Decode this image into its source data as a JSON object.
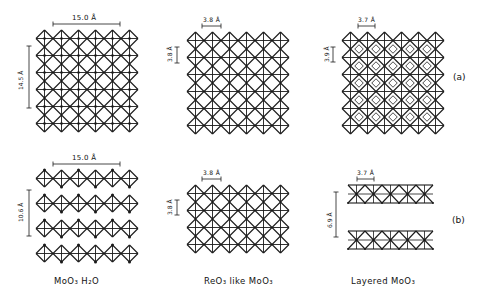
{
  "figure": {
    "rows": [
      {
        "id": "a",
        "label": "(a)"
      },
      {
        "id": "b",
        "label": "(b)"
      }
    ],
    "columns": [
      {
        "id": "moo3-h2o",
        "caption": "MoO₃ H₂O"
      },
      {
        "id": "reo3-like",
        "caption": "ReO₃ like MoO₃"
      },
      {
        "id": "layered",
        "caption": "Layered MoO₃"
      }
    ],
    "panels": {
      "a1": {
        "type": "grid",
        "x": 36,
        "y": 30,
        "cell": 17,
        "cols": 6,
        "rows": 6,
        "dots": true,
        "sub": false,
        "h_label": "15.0 Å",
        "h_bar": [
          53,
          120,
          24
        ],
        "v_label": "14.5 Å",
        "v_bar": [
          29,
          46,
          108
        ]
      },
      "a2": {
        "type": "grid",
        "x": 187,
        "y": 32,
        "cell": 17,
        "cols": 6,
        "rows": 6,
        "dots": false,
        "sub": false,
        "h_label": "3.8 Å",
        "h_bar": [
          202,
          221,
          26
        ],
        "v_label": "3.8 Å",
        "v_bar": [
          177,
          47,
          63
        ]
      },
      "a3": {
        "type": "grid",
        "x": 342,
        "y": 32,
        "cell": 17,
        "cols": 6,
        "rows": 6,
        "dots": false,
        "sub": true,
        "h_label": "3.7 Å",
        "h_bar": [
          358,
          375,
          26
        ],
        "v_label": "3.9 Å",
        "v_bar": [
          333,
          47,
          62
        ]
      },
      "b1": {
        "type": "chains",
        "x": 36,
        "y": 170,
        "cell": 17,
        "cols": 6,
        "rows": 4,
        "gap": 25,
        "h_label": "15.0 Å",
        "h_bar": [
          53,
          120,
          164
        ],
        "v_label": "10.6 Å",
        "v_bar": [
          29,
          190,
          236
        ]
      },
      "b2": {
        "type": "grid",
        "x": 187,
        "y": 185,
        "cell": 17,
        "cols": 6,
        "rows": 4,
        "dots": false,
        "sub": false,
        "h_label": "3.8 Å",
        "h_bar": [
          202,
          221,
          179
        ],
        "v_label": "3.8 Å",
        "v_bar": [
          177,
          200,
          215
        ]
      },
      "b3": {
        "type": "layers",
        "x": 348,
        "y": 185,
        "w": 17,
        "cols": 5,
        "h": 18,
        "layer_gap": 46,
        "h_label": "3.7 Å",
        "h_bar": [
          357,
          374,
          179
        ],
        "v_label": "6.9 Å",
        "v_bar": [
          336,
          192,
          237
        ]
      }
    }
  }
}
